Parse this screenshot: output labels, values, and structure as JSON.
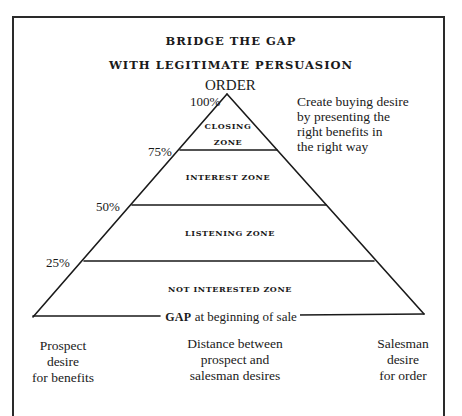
{
  "title": {
    "line1": "BRIDGE THE GAP",
    "line2": "WITH LEGITIMATE PERSUASION"
  },
  "apex_label": "ORDER",
  "levels": [
    {
      "percent": "100%"
    },
    {
      "percent": "75%"
    },
    {
      "percent": "50%"
    },
    {
      "percent": "25%"
    }
  ],
  "zones": [
    {
      "name_line1": "CLOSING",
      "name_line2": "ZONE"
    },
    {
      "name": "INTEREST ZONE"
    },
    {
      "name": "LISTENING ZONE"
    },
    {
      "name": "NOT INTERESTED ZONE"
    }
  ],
  "side_note": {
    "lines": [
      "Create buying desire",
      "by presenting the",
      "right benefits in",
      "the right way"
    ]
  },
  "gap": {
    "word": "GAP",
    "rest": " at beginning of sale"
  },
  "footer": {
    "left": [
      "Prospect",
      "desire",
      "for benefits"
    ],
    "center": [
      "Distance between",
      "prospect and",
      "salesman desires"
    ],
    "right": [
      "Salesman",
      "desire",
      "for order"
    ]
  },
  "colors": {
    "ink": "#1a1a1a",
    "background": "#ffffff"
  }
}
